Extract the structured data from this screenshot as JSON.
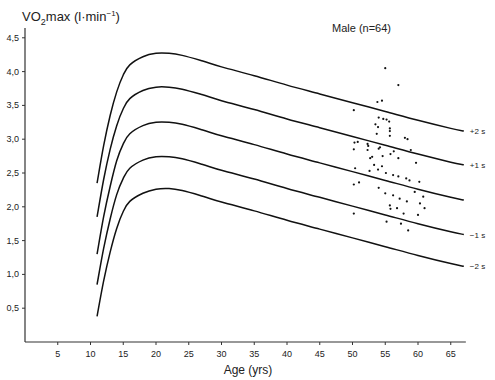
{
  "chart_data": {
    "type": "line",
    "title": "",
    "annotation": "Male (n=64)",
    "ylabel": "VO2max (l·min⁻¹)",
    "ylabel_parts": {
      "pre": "VO",
      "sub": "2",
      "post": "max (l·min",
      "sup": "−1",
      "end": ")"
    },
    "xlabel": "Age (yrs)",
    "xlim": [
      0,
      67
    ],
    "ylim": [
      0,
      4.6
    ],
    "x_ticks": [
      5,
      10,
      15,
      20,
      25,
      30,
      35,
      40,
      45,
      50,
      55,
      60,
      65
    ],
    "x_tick_labels": [
      "5",
      "10",
      "15",
      "20",
      "25",
      "30",
      "35",
      "40",
      "45",
      "50",
      "55",
      "60",
      "65"
    ],
    "y_ticks": [
      0.5,
      1.0,
      1.5,
      2.0,
      2.5,
      3.0,
      3.5,
      4.0,
      4.5
    ],
    "y_tick_labels": [
      "0,5",
      "1,0",
      "1,5",
      "2,0",
      "2,5",
      "3,0",
      "3,5",
      "4,0",
      "4,5"
    ],
    "grid": false,
    "legend": "none",
    "series": [
      {
        "name": "+2 s",
        "label": "+2 s",
        "x": [
          11,
          12,
          13,
          14,
          15,
          16,
          18,
          20,
          22,
          24,
          27,
          30,
          35,
          40,
          45,
          50,
          55,
          60,
          65,
          67
        ],
        "values": [
          2.35,
          2.9,
          3.35,
          3.7,
          3.95,
          4.1,
          4.22,
          4.27,
          4.27,
          4.24,
          4.16,
          4.07,
          3.94,
          3.8,
          3.67,
          3.54,
          3.41,
          3.28,
          3.16,
          3.12
        ]
      },
      {
        "name": "+1 s",
        "label": "+1 s",
        "x": [
          11,
          12,
          13,
          14,
          15,
          16,
          18,
          20,
          22,
          24,
          27,
          30,
          35,
          40,
          45,
          50,
          55,
          60,
          65,
          67
        ],
        "values": [
          1.85,
          2.4,
          2.85,
          3.2,
          3.45,
          3.6,
          3.72,
          3.77,
          3.77,
          3.74,
          3.66,
          3.57,
          3.44,
          3.3,
          3.17,
          3.04,
          2.91,
          2.78,
          2.66,
          2.62
        ]
      },
      {
        "name": "mean",
        "label": "",
        "x": [
          11,
          12,
          13,
          14,
          15,
          16,
          18,
          20,
          22,
          24,
          27,
          30,
          35,
          40,
          45,
          50,
          55,
          60,
          65,
          67
        ],
        "values": [
          1.3,
          1.85,
          2.3,
          2.68,
          2.93,
          3.08,
          3.2,
          3.25,
          3.25,
          3.22,
          3.14,
          3.05,
          2.92,
          2.78,
          2.65,
          2.52,
          2.39,
          2.26,
          2.14,
          2.1
        ]
      },
      {
        "name": "-1 s",
        "label": "−1 s",
        "x": [
          11,
          12,
          13,
          14,
          15,
          16,
          18,
          20,
          22,
          24,
          27,
          30,
          35,
          40,
          45,
          50,
          55,
          60,
          65,
          67
        ],
        "values": [
          0.85,
          1.38,
          1.82,
          2.18,
          2.42,
          2.57,
          2.69,
          2.74,
          2.74,
          2.71,
          2.63,
          2.54,
          2.41,
          2.27,
          2.14,
          2.01,
          1.88,
          1.75,
          1.63,
          1.59
        ]
      },
      {
        "name": "-2 s",
        "label": "−2 s",
        "x": [
          11,
          12,
          13,
          14,
          15,
          16,
          18,
          20,
          22,
          24,
          27,
          30,
          35,
          40,
          45,
          50,
          55,
          60,
          65,
          67
        ],
        "values": [
          0.38,
          0.9,
          1.33,
          1.68,
          1.93,
          2.08,
          2.2,
          2.26,
          2.27,
          2.24,
          2.16,
          2.07,
          1.94,
          1.8,
          1.67,
          1.54,
          1.41,
          1.28,
          1.16,
          1.12
        ]
      }
    ],
    "scatter": {
      "name": "Male subjects",
      "n": 64,
      "points": [
        [
          55.0,
          4.05
        ],
        [
          57.0,
          3.8
        ],
        [
          54.5,
          3.57
        ],
        [
          53.8,
          3.55
        ],
        [
          50.2,
          3.43
        ],
        [
          54.0,
          3.32
        ],
        [
          54.7,
          3.3
        ],
        [
          55.2,
          3.29
        ],
        [
          55.6,
          3.26
        ],
        [
          53.5,
          3.22
        ],
        [
          53.9,
          3.18
        ],
        [
          55.7,
          3.16
        ],
        [
          55.7,
          3.12
        ],
        [
          53.7,
          3.08
        ],
        [
          55.7,
          3.05
        ],
        [
          58.0,
          3.02
        ],
        [
          58.4,
          3.0
        ],
        [
          50.3,
          2.95
        ],
        [
          50.8,
          2.96
        ],
        [
          52.3,
          2.93
        ],
        [
          52.4,
          2.9
        ],
        [
          54.0,
          2.86
        ],
        [
          54.2,
          2.88
        ],
        [
          55.8,
          2.78
        ],
        [
          56.3,
          2.82
        ],
        [
          58.9,
          2.84
        ],
        [
          50.2,
          2.85
        ],
        [
          52.3,
          2.84
        ],
        [
          52.7,
          2.72
        ],
        [
          53.0,
          2.74
        ],
        [
          54.6,
          2.75
        ],
        [
          57.0,
          2.72
        ],
        [
          59.7,
          2.65
        ],
        [
          50.4,
          2.57
        ],
        [
          52.6,
          2.53
        ],
        [
          53.9,
          2.55
        ],
        [
          54.5,
          2.6
        ],
        [
          55.1,
          2.5
        ],
        [
          56.2,
          2.47
        ],
        [
          57.0,
          2.45
        ],
        [
          58.2,
          2.42
        ],
        [
          58.7,
          2.39
        ],
        [
          50.2,
          2.33
        ],
        [
          51.0,
          2.36
        ],
        [
          54.0,
          2.28
        ],
        [
          55.0,
          2.2
        ],
        [
          56.2,
          2.17
        ],
        [
          57.2,
          2.12
        ],
        [
          58.3,
          2.08
        ],
        [
          60.3,
          2.05
        ],
        [
          60.8,
          2.15
        ],
        [
          55.7,
          2.02
        ],
        [
          55.8,
          1.97
        ],
        [
          56.8,
          1.98
        ],
        [
          57.8,
          1.9
        ],
        [
          60.0,
          1.88
        ],
        [
          50.2,
          1.9
        ],
        [
          55.2,
          1.78
        ],
        [
          58.5,
          1.65
        ],
        [
          60.2,
          2.37
        ],
        [
          59.5,
          2.22
        ],
        [
          61.0,
          1.98
        ],
        [
          57.4,
          1.75
        ],
        [
          53.3,
          2.62
        ]
      ]
    }
  }
}
